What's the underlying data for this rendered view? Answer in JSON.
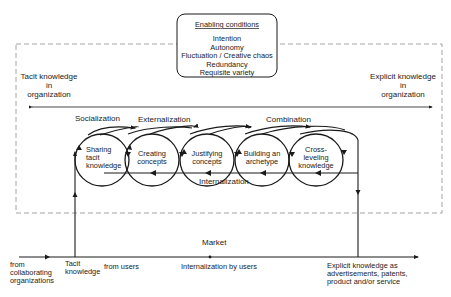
{
  "enabling_conditions": {
    "title": "Enabling conditions",
    "items": [
      "Intention",
      "Autonomy",
      "Fluctuation / Creative chaos",
      "Redundancy",
      "Requisite variety"
    ]
  },
  "axis": {
    "left_label": [
      "Tacit knowledge",
      "in",
      "organization"
    ],
    "right_label": [
      "Explicit knowledge",
      "in",
      "organization"
    ]
  },
  "phase_labels": {
    "socialization": "Socialization",
    "externalization": "Externalization",
    "combination": "Combination",
    "internalization": "Internalization"
  },
  "phases": [
    {
      "lines": [
        "Sharing",
        "tacit",
        "knowledge"
      ]
    },
    {
      "lines": [
        "Creating",
        "concepts"
      ]
    },
    {
      "lines": [
        "Justifying",
        "concepts"
      ]
    },
    {
      "lines": [
        "Building an",
        "archetype"
      ]
    },
    {
      "lines": [
        "Cross-",
        "leveling",
        "knowledge"
      ]
    }
  ],
  "market": {
    "title": "Market",
    "from_collab": [
      "from",
      "collaborating",
      "organizations"
    ],
    "tacit_knowledge": [
      "Tacit",
      "knowledge"
    ],
    "from_users": "from users",
    "internalization_by_users": "Internalization by users",
    "explicit_out": [
      "Explicit knowledge as",
      "advertisements, patents,",
      "product and/or service"
    ]
  },
  "colors": {
    "line": "#1a1a1a",
    "dashed": "#9a9a9a",
    "text": "#222222"
  }
}
